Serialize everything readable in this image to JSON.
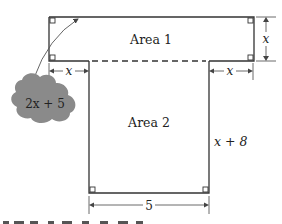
{
  "figure": {
    "type": "geometry-diagram",
    "shapes": [
      {
        "name": "Area 1",
        "label": "Area 1",
        "width_label": "2x + 5",
        "height_label": "x"
      },
      {
        "name": "Area 2",
        "label": "Area 2",
        "width_label": "5",
        "height_label": "x + 8"
      }
    ],
    "labels": {
      "area1": "Area 1",
      "area2": "Area 2",
      "top_height": "x",
      "left_overhang": "x",
      "right_overhang": "x",
      "bottom_height": "x + 8",
      "bottom_width": "5",
      "cloud_label": "2x + 5"
    },
    "colors": {
      "line": "#333333",
      "cloud": "#8a8a8a",
      "background": "#ffffff"
    }
  }
}
